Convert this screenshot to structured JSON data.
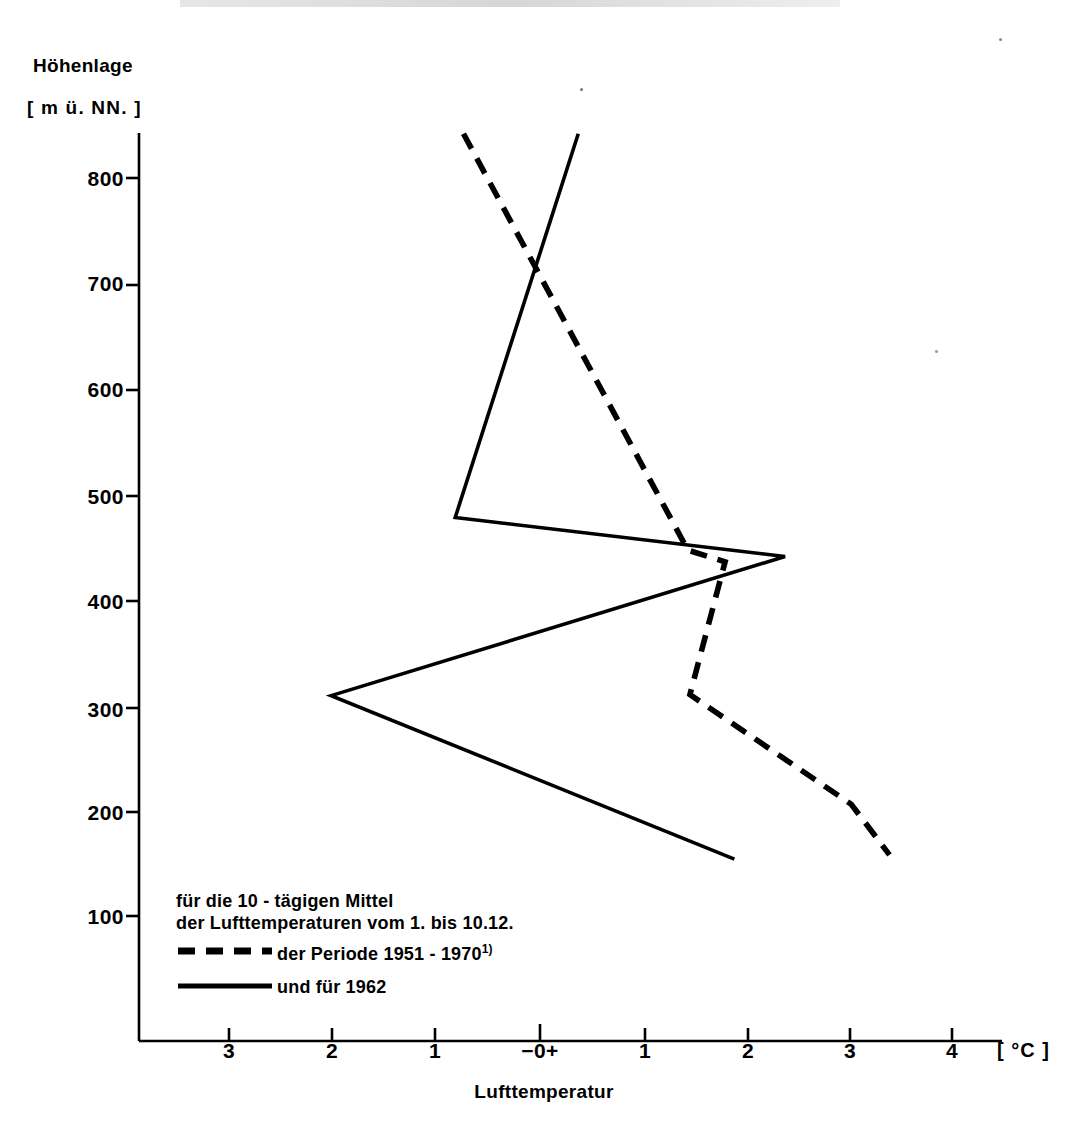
{
  "axes": {
    "y_title_line1": "Höhenlage",
    "y_title_line2": "[ m ü. NN. ]",
    "y_ticks": [
      "800",
      "700",
      "600",
      "500",
      "400",
      "300",
      "200",
      "100"
    ],
    "x_ticks": [
      "3",
      "2",
      "1",
      "−0+",
      "1",
      "2",
      "3",
      "4"
    ],
    "x_unit": "[ °C ]",
    "x_title": "Lufttemperatur"
  },
  "legend": {
    "caption_line1": "für die 10 - tägigen Mittel",
    "caption_line2": "der Lufttemperaturen vom 1. bis 10.12.",
    "series1_label": "der Periode 1951 - 1970",
    "series1_superscript": "1)",
    "series2_label": "und für 1962"
  },
  "chart_data": {
    "type": "line",
    "title": "",
    "xlabel": "Lufttemperatur",
    "ylabel": "Höhenlage [ m ü. NN. ]",
    "xunit": "°C",
    "yunit": "m ü. NN.",
    "xlim": [
      -3.5,
      4.4
    ],
    "ylim": [
      0,
      870
    ],
    "xticks": [
      -3,
      -2,
      -1,
      0,
      1,
      2,
      3,
      4
    ],
    "xticklabels": [
      "3",
      "2",
      "1",
      "−0+",
      "1",
      "2",
      "3",
      "4"
    ],
    "yticks": [
      100,
      200,
      300,
      400,
      500,
      600,
      700,
      800
    ],
    "grid": false,
    "legend_position": "lower-left",
    "series": [
      {
        "name": "der Periode 1951 - 1970",
        "style": "dashed",
        "color": "#000000",
        "points": [
          {
            "x": -0.74,
            "y": 842
          },
          {
            "x": 1.43,
            "y": 447
          },
          {
            "x": 1.79,
            "y": 436
          },
          {
            "x": 1.45,
            "y": 310
          },
          {
            "x": 3.01,
            "y": 206
          },
          {
            "x": 3.38,
            "y": 158
          }
        ]
      },
      {
        "name": "und für 1962",
        "style": "solid",
        "color": "#000000",
        "points": [
          {
            "x": 0.37,
            "y": 842
          },
          {
            "x": -0.82,
            "y": 478
          },
          {
            "x": 2.37,
            "y": 441
          },
          {
            "x": -2.02,
            "y": 309
          },
          {
            "x": 1.88,
            "y": 154
          }
        ]
      }
    ]
  }
}
